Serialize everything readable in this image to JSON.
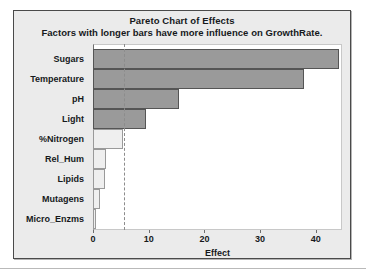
{
  "chart_data": {
    "type": "bar",
    "orientation": "horizontal",
    "title": "Pareto Chart of Effects",
    "subtitle": "Factors with longer bars have more influence on GrowthRate.",
    "xlabel": "Effect",
    "ylabel": "",
    "xlim": [
      0,
      44.7
    ],
    "xticks": [
      0,
      10,
      20,
      30,
      40
    ],
    "xticklabels": [
      "0",
      "10",
      "20",
      "30",
      "40"
    ],
    "grid": false,
    "legend": null,
    "reference_line": {
      "value": 5.6,
      "style": "dashed",
      "color": "#8c8c8c",
      "label": ""
    },
    "categories": [
      "Sugars",
      "Temperature",
      "pH",
      "Light",
      "%Nitrogen",
      "Rel_Hum",
      "Lipids",
      "Mutagens",
      "Micro_Enzms"
    ],
    "values": [
      44.1,
      37.8,
      15.4,
      9.5,
      5.4,
      2.3,
      2.2,
      1.3,
      0.6
    ],
    "significant": [
      true,
      true,
      true,
      true,
      false,
      false,
      false,
      false,
      false
    ],
    "bar_colors": {
      "significant": "#9a9a9a",
      "not_significant": "#efefef"
    }
  },
  "figure": {
    "background": "#ebebeb",
    "plot_background": "#ffffff",
    "border_color": "#4a4a4a"
  }
}
